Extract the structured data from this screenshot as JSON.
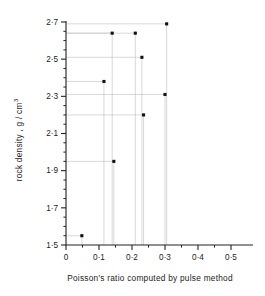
{
  "chart_data": {
    "type": "scatter",
    "title": "",
    "xlabel": "Poisson's ratio computed by pulse method",
    "ylabel": "rock density , g / cm",
    "ylabel_exponent": "3",
    "xlim": [
      0,
      0.5
    ],
    "ylim": [
      1.5,
      2.7
    ],
    "x_ticks": [
      0,
      0.1,
      0.2,
      0.3,
      0.4,
      0.5
    ],
    "x_tick_labels": [
      "0",
      "0·1",
      "0·2",
      "0·3",
      "0·4",
      "0·5"
    ],
    "x_minor_step": 0.05,
    "y_ticks": [
      1.5,
      1.7,
      1.9,
      2.1,
      2.3,
      2.5,
      2.7
    ],
    "y_tick_labels": [
      "1·5",
      "1·7",
      "1·9",
      "2·1",
      "2·3",
      "2·5",
      "2·7"
    ],
    "y_minor_step": 0.05,
    "grid": false,
    "leader_lines": true,
    "legend": null,
    "marker": "filled-square",
    "marker_color": "#111111",
    "points": [
      {
        "x": 0.048,
        "y": 1.55
      },
      {
        "x": 0.145,
        "y": 1.95
      },
      {
        "x": 0.115,
        "y": 2.38
      },
      {
        "x": 0.235,
        "y": 2.2
      },
      {
        "x": 0.3,
        "y": 2.31
      },
      {
        "x": 0.23,
        "y": 2.51
      },
      {
        "x": 0.14,
        "y": 2.64
      },
      {
        "x": 0.21,
        "y": 2.64
      },
      {
        "x": 0.305,
        "y": 2.69
      }
    ]
  }
}
